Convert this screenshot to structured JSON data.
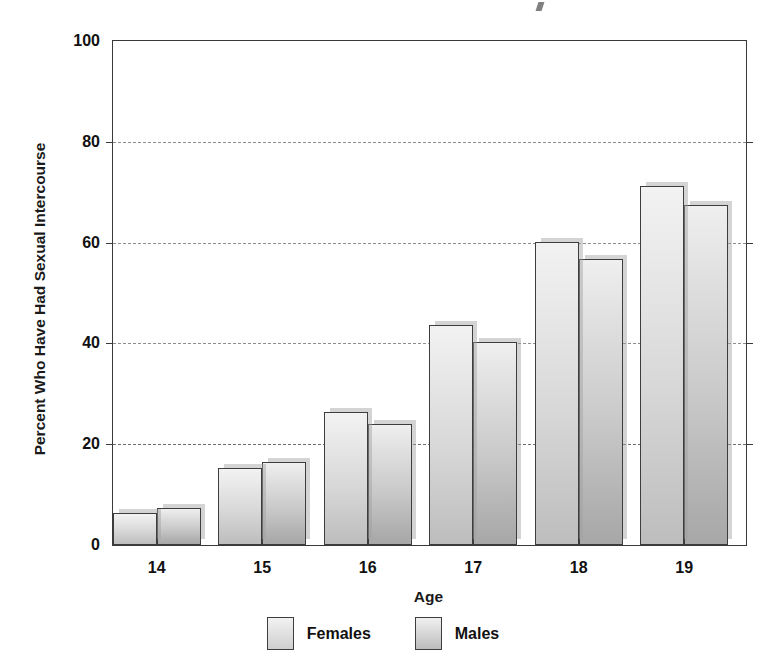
{
  "chart_data": {
    "type": "bar",
    "title": "",
    "xlabel": "Age",
    "ylabel": "Percent Who Have Had Sexual Intercourse",
    "categories": [
      "14",
      "15",
      "16",
      "17",
      "18",
      "19"
    ],
    "series": [
      {
        "name": "Females",
        "values": [
          6.3,
          15.2,
          26.3,
          43.7,
          60.2,
          71.2
        ],
        "color": "#d8d8d8"
      },
      {
        "name": "Males",
        "values": [
          7.4,
          16.5,
          24.1,
          40.2,
          56.7,
          67.4
        ],
        "color": "#c2c2c2"
      }
    ],
    "ylim": [
      0,
      100
    ],
    "yticks": [
      "0",
      "20",
      "40",
      "60",
      "80",
      "100"
    ],
    "ytick_values": [
      0,
      20,
      40,
      60,
      80,
      100
    ],
    "grid": "horizontal-dashed",
    "legend_position": "bottom-center",
    "axis_frame": "box",
    "units": "percent"
  },
  "legend": {
    "entries": [
      {
        "label": "Females",
        "swatch": "female-swatch"
      },
      {
        "label": "Males",
        "swatch": "male-swatch"
      }
    ]
  }
}
